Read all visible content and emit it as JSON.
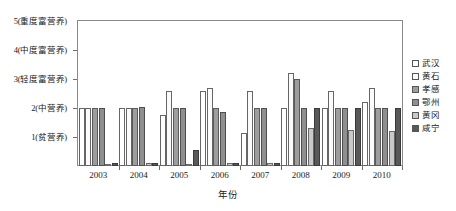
{
  "chart_data": {
    "type": "bar",
    "title": "",
    "xlabel": "年份",
    "ylabel": "",
    "grid": false,
    "legend_position": "right",
    "ylim": [
      0,
      5
    ],
    "categories": [
      "2003",
      "2004",
      "2005",
      "2006",
      "2007",
      "2008",
      "2009",
      "2010"
    ],
    "y_ticks": [
      {
        "value": 5,
        "label": "5(重度富营养)"
      },
      {
        "value": 4,
        "label": "4(中度富营养)"
      },
      {
        "value": 3,
        "label": "3(轻度富营养)"
      },
      {
        "value": 2,
        "label": "2(中营养)"
      },
      {
        "value": 1,
        "label": "1(贫营养)"
      }
    ],
    "series": [
      {
        "name": "武汉",
        "color": "#ffffff",
        "values": [
          2.0,
          2.0,
          1.75,
          2.6,
          1.15,
          2.0,
          2.0,
          2.2
        ]
      },
      {
        "name": "黄石",
        "color": "#fbfbfb",
        "values": [
          2.0,
          2.0,
          2.6,
          2.7,
          2.6,
          3.2,
          2.6,
          2.7
        ]
      },
      {
        "name": "孝感",
        "color": "#9d9d9d",
        "values": [
          2.0,
          2.0,
          2.0,
          2.0,
          2.0,
          3.0,
          2.0,
          2.0
        ]
      },
      {
        "name": "鄂州",
        "color": "#8f8f8f",
        "values": [
          2.0,
          2.05,
          2.0,
          1.85,
          2.0,
          2.0,
          2.0,
          2.0
        ]
      },
      {
        "name": "黄冈",
        "color": "#c9c9c9",
        "values": [
          0.07,
          0.12,
          0.08,
          0.1,
          0.1,
          1.3,
          1.25,
          1.2
        ]
      },
      {
        "name": "咸宁",
        "color": "#595959",
        "values": [
          0.1,
          0.1,
          0.55,
          0.12,
          0.12,
          2.0,
          2.0,
          2.0
        ]
      }
    ]
  }
}
